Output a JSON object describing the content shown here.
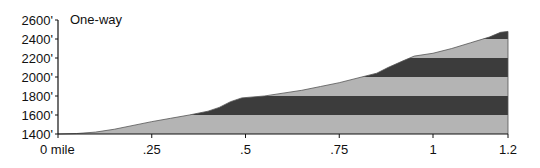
{
  "chart_data": {
    "type": "area",
    "title": "One-way",
    "xlabel": "",
    "ylabel": "",
    "x_unit": "mile",
    "y_unit": "ft",
    "xlim": [
      0,
      1.2
    ],
    "ylim": [
      1400,
      2600
    ],
    "x_ticks": [
      0,
      0.25,
      0.5,
      0.75,
      1,
      1.2
    ],
    "x_tick_labels": [
      "0 mile",
      ".25",
      ".5",
      ".75",
      "1",
      "1.2"
    ],
    "y_ticks": [
      1400,
      1600,
      1800,
      2000,
      2200,
      2400,
      2600
    ],
    "y_tick_labels": [
      "1400'",
      "1600'",
      "1800'",
      "2000'",
      "2200'",
      "2400'",
      "2600'"
    ],
    "grid": false,
    "legend": null,
    "banding": {
      "description": "Fill alternates light/dark gray every 200 ft",
      "light_color": "#b4b4b4",
      "dark_color": "#3c3c3c"
    },
    "series": [
      {
        "name": "Elevation profile",
        "x": [
          0,
          0.05,
          0.1,
          0.15,
          0.2,
          0.25,
          0.3,
          0.35,
          0.4,
          0.43,
          0.46,
          0.49,
          0.52,
          0.55,
          0.6,
          0.65,
          0.7,
          0.75,
          0.8,
          0.85,
          0.88,
          0.92,
          0.95,
          1.0,
          1.05,
          1.1,
          1.15,
          1.18,
          1.2
        ],
        "values": [
          1400,
          1405,
          1420,
          1450,
          1490,
          1530,
          1565,
          1600,
          1640,
          1680,
          1740,
          1780,
          1790,
          1800,
          1830,
          1860,
          1900,
          1940,
          1990,
          2040,
          2100,
          2170,
          2220,
          2250,
          2300,
          2360,
          2420,
          2470,
          2480
        ]
      }
    ]
  },
  "labels": {
    "caption": "One-way"
  }
}
